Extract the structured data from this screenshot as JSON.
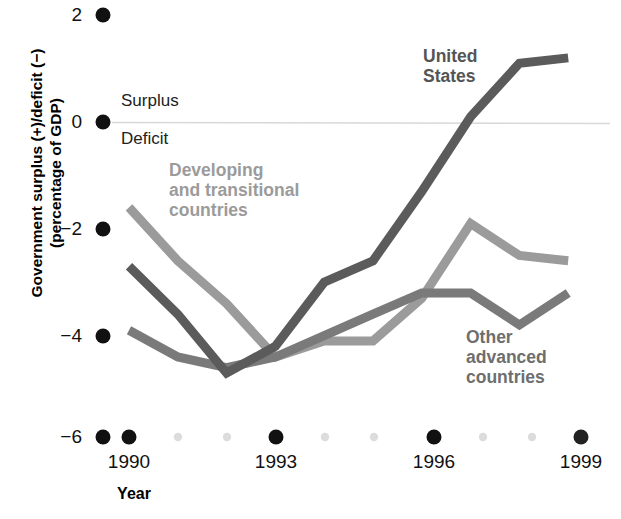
{
  "chart_data": {
    "type": "line",
    "title": "",
    "xlabel": "Year",
    "ylabel": "Government surplus (+)/deficit (−) (percentage of GDP)",
    "ylabel_line1": "Government surplus (+)/deficit (−)",
    "ylabel_line2": "(percentage of GDP)",
    "x": [
      1990,
      1991,
      1992,
      1993,
      1994,
      1995,
      1996,
      1997,
      1998,
      1999
    ],
    "xlim": [
      1989.2,
      1999.6
    ],
    "ylim": [
      -6.3,
      2.3
    ],
    "xticks": [
      1990,
      1993,
      1996,
      1999
    ],
    "xtick_labels": [
      "1990",
      "1993",
      "1996",
      "1999"
    ],
    "xminor": [
      1991,
      1992,
      1994,
      1995,
      1997,
      1998
    ],
    "yticks": [
      2,
      0,
      -2,
      -4,
      -6
    ],
    "ytick_labels": [
      "2",
      "0",
      "−2",
      "−4",
      "−6"
    ],
    "grid": false,
    "zero_line": 0,
    "zero_line_color": "#d8d8d8",
    "legend_position": "inline-annotations",
    "series": [
      {
        "name": "United States",
        "color": "#5b5b5b",
        "values": [
          -2.7,
          -3.6,
          -4.7,
          -4.2,
          -3.0,
          -2.6,
          -1.3,
          0.1,
          1.1,
          1.2
        ]
      },
      {
        "name": "Developing and transitional countries",
        "color": "#9b9b9b",
        "values": [
          -1.6,
          -2.6,
          -3.4,
          -4.4,
          -4.1,
          -4.1,
          -3.3,
          -1.9,
          -2.5,
          -2.6
        ]
      },
      {
        "name": "Other advanced countries",
        "color": "#7a7a7a",
        "values": [
          -3.9,
          -4.4,
          -4.6,
          -4.4,
          -4.0,
          -3.6,
          -3.2,
          -3.2,
          -3.8,
          -3.2
        ]
      }
    ],
    "annotations": [
      {
        "text": "Surplus",
        "x": 1990.1,
        "y": 0.45,
        "color": "#222222"
      },
      {
        "text": "Deficit",
        "x": 1990.1,
        "y": -0.5,
        "color": "#222222"
      }
    ]
  },
  "axis": {
    "y_title_line1": "Government surplus (+)/deficit (−)",
    "y_title_line2": "(percentage of GDP)",
    "x_title": "Year",
    "ytick_labels": [
      "2",
      "0",
      "−2",
      "−4",
      "−6"
    ],
    "xtick_labels": [
      "1990",
      "1993",
      "1996",
      "1999"
    ]
  },
  "annotations": {
    "surplus": "Surplus",
    "deficit": "Deficit"
  },
  "series_labels": {
    "united_states_line1": "United",
    "united_states_line2": "States",
    "developing_line1": "Developing",
    "developing_line2": "and transitional",
    "developing_line3": "countries",
    "other_advanced_line1": "Other",
    "other_advanced_line2": "advanced",
    "other_advanced_line3": "countries"
  },
  "colors": {
    "united_states": "#5b5b5b",
    "developing": "#9b9b9b",
    "other_advanced": "#7a7a7a",
    "tick_dot_major": "#111111",
    "tick_dot_minor": "#dcdcdc",
    "zero_line": "#d8d8d8"
  }
}
